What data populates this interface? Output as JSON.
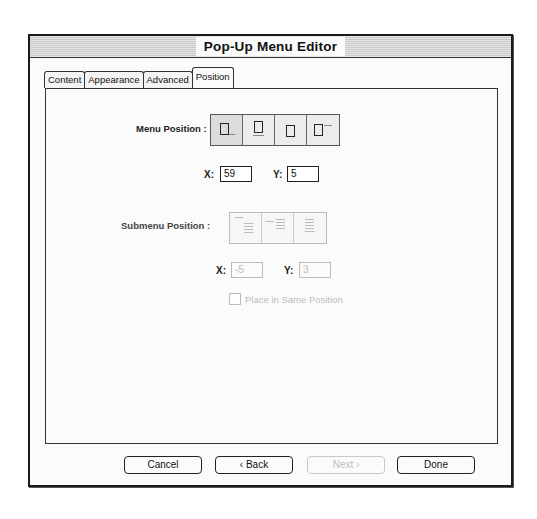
{
  "window": {
    "title": "Pop-Up Menu Editor"
  },
  "tabs": [
    {
      "label": "Content",
      "active": false
    },
    {
      "label": "Appearance",
      "active": false
    },
    {
      "label": "Advanced",
      "active": false
    },
    {
      "label": "Position",
      "active": true
    }
  ],
  "menu_position": {
    "label": "Menu Position :",
    "options": [
      {
        "icon": "position-below-right-icon"
      },
      {
        "icon": "position-below-icon"
      },
      {
        "icon": "position-centered-icon"
      },
      {
        "icon": "position-right-icon"
      }
    ],
    "x_label": "X:",
    "x_value": "59",
    "y_label": "Y:",
    "y_value": "5"
  },
  "submenu_position": {
    "label": "Submenu Position :",
    "enabled": false,
    "options": [
      {
        "icon": "submenu-below-right-icon"
      },
      {
        "icon": "submenu-right-icon"
      },
      {
        "icon": "submenu-stacked-icon"
      }
    ],
    "x_label": "X:",
    "x_value": "-5",
    "y_label": "Y:",
    "y_value": "3",
    "same_position_label": "Place in Same Position",
    "same_position_checked": false
  },
  "buttons": {
    "cancel": "Cancel",
    "back": "‹ Back",
    "next": "Next ›",
    "done": "Done"
  }
}
